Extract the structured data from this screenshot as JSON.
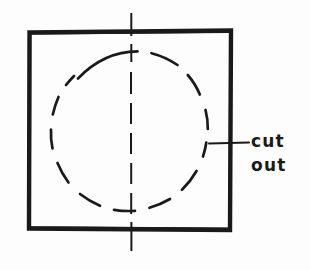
{
  "figure": {
    "background_color": "#fdfdfd",
    "ink_color": "#1a1a1a",
    "style": "hand-drawn technical sketch"
  },
  "annotation": {
    "label_line_1": "cut",
    "label_line_2": "out",
    "full_text": "cut out",
    "leader_line": {
      "from_x": 210,
      "from_y": 143,
      "to_x": 249,
      "to_y": 143
    }
  },
  "shapes": {
    "square": {
      "name": "outer-square",
      "stroke": "solid",
      "stroke_color": "#1a1a1a",
      "stroke_width": 4,
      "x": 30,
      "y": 31,
      "width": 200,
      "height": 198
    },
    "circle": {
      "name": "cut-out-circle",
      "stroke": "dashed",
      "stroke_color": "#1a1a1a",
      "stroke_width": 2.6,
      "center_x": 131,
      "center_y": 131,
      "radius": 80,
      "dash_pattern": "14 12"
    },
    "centerline": {
      "name": "vertical-centerline",
      "stroke": "dash-dot",
      "stroke_color": "#1a1a1a",
      "stroke_width": 2,
      "x": 131,
      "y_top": 13,
      "y_bottom": 251,
      "dash_pattern": "18 8"
    }
  }
}
